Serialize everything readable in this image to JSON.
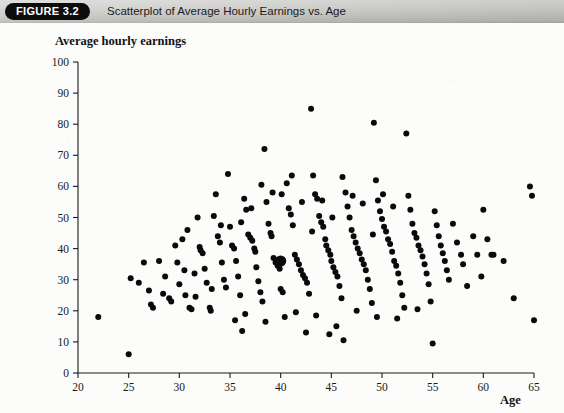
{
  "header": {
    "badge_label": "FIGURE 3.2",
    "caption": "Scatterplot of Average Hourly Earnings vs. Age",
    "badge_bg": "#0d0d0d",
    "badge_fg": "#ffffff",
    "bar_bg": "#cccccA"
  },
  "axis_titles": {
    "y": "Average hourly earnings",
    "x": "Age"
  },
  "chart_data": {
    "type": "scatter",
    "title": "Scatterplot of Average Hourly Earnings vs. Age",
    "xlabel": "Age",
    "ylabel": "Average hourly earnings",
    "xlim": [
      20,
      65
    ],
    "ylim": [
      0,
      100
    ],
    "xticks": [
      20,
      25,
      30,
      35,
      40,
      45,
      50,
      55,
      60,
      65
    ],
    "yticks": [
      0,
      10,
      20,
      30,
      40,
      50,
      60,
      70,
      80,
      90,
      100
    ],
    "grid": false,
    "legend": null,
    "marker_color": "#0a0a0a",
    "marker_size": 3.0,
    "highlight_marker_size": 5.6,
    "highlight_point": {
      "x": 40,
      "y": 36,
      "label": "sample mean"
    },
    "series": [
      {
        "name": "workers",
        "points": [
          [
            22.0,
            18.0
          ],
          [
            25.0,
            6.0
          ],
          [
            25.2,
            30.5
          ],
          [
            26.0,
            29.0
          ],
          [
            27.0,
            26.5
          ],
          [
            27.2,
            22.0
          ],
          [
            27.4,
            21.0
          ],
          [
            28.0,
            36.0
          ],
          [
            28.6,
            31.0
          ],
          [
            29.0,
            24.0
          ],
          [
            29.2,
            23.0
          ],
          [
            29.6,
            41.0
          ],
          [
            30.0,
            28.5
          ],
          [
            30.3,
            43.0
          ],
          [
            30.8,
            46.0
          ],
          [
            31.0,
            21.0
          ],
          [
            31.2,
            20.5
          ],
          [
            31.6,
            24.5
          ],
          [
            31.8,
            50.0
          ],
          [
            32.0,
            40.5
          ],
          [
            32.1,
            39.5
          ],
          [
            32.3,
            38.5
          ],
          [
            32.5,
            33.5
          ],
          [
            32.7,
            29.0
          ],
          [
            33.0,
            21.0
          ],
          [
            33.1,
            20.0
          ],
          [
            33.4,
            50.5
          ],
          [
            33.6,
            57.5
          ],
          [
            33.8,
            44.0
          ],
          [
            34.0,
            42.0
          ],
          [
            34.2,
            35.5
          ],
          [
            34.4,
            30.0
          ],
          [
            34.6,
            27.5
          ],
          [
            34.8,
            64.0
          ],
          [
            35.0,
            47.0
          ],
          [
            35.2,
            41.0
          ],
          [
            35.4,
            40.0
          ],
          [
            35.6,
            36.0
          ],
          [
            35.8,
            31.0
          ],
          [
            36.0,
            25.0
          ],
          [
            36.2,
            13.5
          ],
          [
            36.4,
            56.0
          ],
          [
            36.6,
            52.5
          ],
          [
            36.8,
            44.5
          ],
          [
            37.0,
            43.5
          ],
          [
            37.2,
            42.5
          ],
          [
            37.4,
            40.0
          ],
          [
            37.5,
            39.0
          ],
          [
            37.6,
            34.0
          ],
          [
            37.8,
            29.5
          ],
          [
            38.0,
            26.0
          ],
          [
            38.2,
            23.0
          ],
          [
            38.4,
            72.0
          ],
          [
            38.6,
            55.0
          ],
          [
            38.8,
            48.0
          ],
          [
            39.0,
            45.0
          ],
          [
            39.1,
            44.0
          ],
          [
            39.3,
            37.0
          ],
          [
            39.5,
            35.5
          ],
          [
            39.7,
            34.5
          ],
          [
            39.9,
            33.5
          ],
          [
            40.0,
            27.0
          ],
          [
            40.2,
            26.0
          ],
          [
            40.4,
            18.0
          ],
          [
            40.6,
            61.0
          ],
          [
            40.8,
            53.0
          ],
          [
            41.0,
            51.0
          ],
          [
            41.2,
            47.5
          ],
          [
            41.4,
            38.0
          ],
          [
            41.6,
            36.5
          ],
          [
            41.8,
            35.0
          ],
          [
            42.0,
            33.0
          ],
          [
            42.2,
            31.5
          ],
          [
            42.4,
            30.5
          ],
          [
            42.6,
            29.0
          ],
          [
            42.8,
            25.5
          ],
          [
            43.0,
            85.0
          ],
          [
            43.2,
            63.5
          ],
          [
            43.4,
            57.5
          ],
          [
            43.6,
            56.0
          ],
          [
            43.8,
            50.5
          ],
          [
            44.0,
            48.5
          ],
          [
            44.2,
            47.0
          ],
          [
            44.4,
            43.0
          ],
          [
            44.5,
            41.0
          ],
          [
            44.7,
            39.5
          ],
          [
            44.9,
            38.0
          ],
          [
            45.0,
            36.0
          ],
          [
            45.2,
            34.0
          ],
          [
            45.4,
            32.5
          ],
          [
            45.6,
            31.0
          ],
          [
            45.8,
            28.0
          ],
          [
            46.0,
            24.0
          ],
          [
            46.2,
            10.5
          ],
          [
            46.4,
            58.0
          ],
          [
            46.6,
            53.5
          ],
          [
            46.8,
            50.0
          ],
          [
            47.0,
            46.0
          ],
          [
            47.2,
            44.0
          ],
          [
            47.4,
            42.0
          ],
          [
            47.6,
            40.0
          ],
          [
            47.8,
            38.5
          ],
          [
            48.0,
            36.5
          ],
          [
            48.2,
            35.0
          ],
          [
            48.4,
            33.0
          ],
          [
            48.6,
            30.0
          ],
          [
            48.8,
            27.0
          ],
          [
            49.0,
            22.5
          ],
          [
            49.2,
            80.5
          ],
          [
            49.4,
            62.0
          ],
          [
            49.6,
            55.5
          ],
          [
            49.8,
            52.0
          ],
          [
            50.0,
            49.5
          ],
          [
            50.2,
            47.0
          ],
          [
            50.4,
            45.5
          ],
          [
            50.6,
            43.0
          ],
          [
            50.8,
            41.5
          ],
          [
            51.0,
            39.0
          ],
          [
            51.2,
            36.0
          ],
          [
            51.4,
            34.5
          ],
          [
            51.6,
            32.0
          ],
          [
            51.8,
            29.0
          ],
          [
            52.0,
            25.0
          ],
          [
            52.2,
            21.0
          ],
          [
            52.4,
            77.0
          ],
          [
            52.6,
            57.0
          ],
          [
            52.8,
            52.5
          ],
          [
            53.0,
            48.0
          ],
          [
            53.2,
            45.0
          ],
          [
            53.4,
            43.5
          ],
          [
            53.6,
            41.0
          ],
          [
            53.8,
            39.5
          ],
          [
            54.0,
            37.5
          ],
          [
            54.2,
            35.0
          ],
          [
            54.4,
            32.0
          ],
          [
            54.6,
            28.5
          ],
          [
            54.8,
            23.0
          ],
          [
            55.0,
            9.5
          ],
          [
            55.2,
            52.0
          ],
          [
            55.4,
            47.5
          ],
          [
            55.6,
            44.0
          ],
          [
            55.8,
            41.0
          ],
          [
            56.0,
            38.5
          ],
          [
            56.2,
            36.0
          ],
          [
            56.4,
            33.0
          ],
          [
            56.6,
            30.0
          ],
          [
            57.0,
            48.0
          ],
          [
            57.4,
            42.0
          ],
          [
            57.8,
            38.0
          ],
          [
            58.0,
            35.0
          ],
          [
            58.4,
            28.0
          ],
          [
            59.0,
            44.0
          ],
          [
            59.4,
            38.0
          ],
          [
            59.8,
            31.0
          ],
          [
            60.0,
            52.5
          ],
          [
            60.4,
            43.0
          ],
          [
            60.8,
            38.0
          ],
          [
            61.0,
            38.0
          ],
          [
            62.0,
            36.0
          ],
          [
            63.0,
            24.0
          ],
          [
            64.6,
            60.0
          ],
          [
            64.8,
            57.0
          ],
          [
            65.0,
            17.0
          ],
          [
            30.5,
            33.0
          ],
          [
            31.5,
            32.0
          ],
          [
            33.2,
            27.0
          ],
          [
            34.1,
            47.5
          ],
          [
            36.1,
            48.5
          ],
          [
            37.1,
            53.0
          ],
          [
            38.1,
            60.5
          ],
          [
            39.2,
            58.0
          ],
          [
            40.1,
            57.5
          ],
          [
            41.1,
            63.5
          ],
          [
            42.1,
            55.0
          ],
          [
            43.1,
            45.5
          ],
          [
            44.1,
            55.5
          ],
          [
            45.1,
            50.0
          ],
          [
            46.1,
            63.0
          ],
          [
            47.1,
            57.0
          ],
          [
            48.1,
            54.5
          ],
          [
            49.1,
            44.5
          ],
          [
            50.1,
            57.5
          ],
          [
            51.1,
            53.5
          ],
          [
            35.5,
            17.0
          ],
          [
            36.5,
            19.0
          ],
          [
            38.5,
            16.5
          ],
          [
            41.5,
            19.5
          ],
          [
            43.5,
            18.5
          ],
          [
            45.5,
            15.0
          ],
          [
            47.5,
            20.0
          ],
          [
            49.5,
            18.0
          ],
          [
            51.5,
            17.5
          ],
          [
            53.5,
            20.5
          ],
          [
            44.8,
            12.5
          ],
          [
            42.5,
            13.0
          ],
          [
            29.8,
            35.5
          ],
          [
            30.6,
            25.0
          ],
          [
            28.4,
            25.5
          ],
          [
            26.5,
            35.5
          ]
        ]
      }
    ]
  }
}
